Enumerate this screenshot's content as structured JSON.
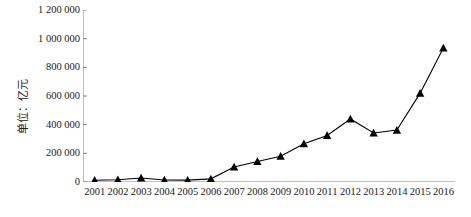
{
  "chart_data": {
    "type": "line",
    "title": "",
    "subtitle": "",
    "xlabel": "",
    "ylabel": "单位：亿元",
    "categories": [
      "2001",
      "2002",
      "2003",
      "2004",
      "2005",
      "2006",
      "2007",
      "2008",
      "2009",
      "2010",
      "2011",
      "2012",
      "2013",
      "2014",
      "2015",
      "2016"
    ],
    "values": [
      12000,
      16000,
      28000,
      14000,
      13000,
      22000,
      105000,
      143000,
      180000,
      267000,
      325000,
      440000,
      342000,
      362000,
      620000,
      935000
    ],
    "series": [
      {
        "name": "",
        "values": [
          12000,
          16000,
          28000,
          14000,
          13000,
          22000,
          105000,
          143000,
          180000,
          267000,
          325000,
          440000,
          342000,
          362000,
          620000,
          935000
        ]
      }
    ],
    "ylim": [
      0,
      1200000
    ],
    "ytick_values": [
      0,
      200000,
      400000,
      600000,
      800000,
      1000000,
      1200000
    ],
    "ytick_labels": [
      "0",
      "200 000",
      "400 000",
      "600 000",
      "800 000",
      "1 000 000",
      "1 200 000"
    ],
    "xtick_labels": [
      "2001",
      "2002",
      "2003",
      "2004",
      "2005",
      "2006",
      "2007",
      "2008",
      "2009",
      "2010",
      "2011",
      "2012",
      "2013",
      "2014",
      "2015",
      "2016"
    ],
    "grid": false,
    "legend": false,
    "legend_position": "none",
    "marker": "triangle",
    "line_color": "#000000",
    "marker_color": "#000000",
    "axis_color": "#808080"
  }
}
